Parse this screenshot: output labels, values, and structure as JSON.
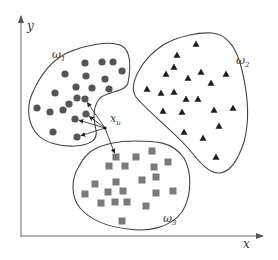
{
  "axes": {
    "x_label": "x",
    "y_label": "y",
    "color": "#6b6b6b"
  },
  "test_point": {
    "label": "x",
    "subscript": "u",
    "pos": [
      105,
      128
    ]
  },
  "classes": [
    {
      "name": "omega1",
      "label": "ω",
      "subscript": "1",
      "marker": "circle",
      "color": "#555555",
      "label_pos": [
        52,
        58
      ],
      "points": [
        [
          85,
          63
        ],
        [
          102,
          62
        ],
        [
          113,
          62
        ],
        [
          65,
          74
        ],
        [
          86,
          76
        ],
        [
          105,
          79
        ],
        [
          122,
          71
        ],
        [
          76,
          87
        ],
        [
          92,
          88
        ],
        [
          109,
          89
        ],
        [
          55,
          93
        ],
        [
          77,
          98
        ],
        [
          85,
          99
        ],
        [
          69,
          104
        ],
        [
          63,
          110
        ],
        [
          50,
          112
        ],
        [
          37,
          108
        ],
        [
          86,
          114
        ],
        [
          75,
          119
        ],
        [
          53,
          132
        ],
        [
          77,
          137
        ]
      ]
    },
    {
      "name": "omega2",
      "label": "ω",
      "subscript": "2",
      "marker": "triangle",
      "color": "#1e1e1e",
      "label_pos": [
        236,
        64
      ],
      "points": [
        [
          196,
          44
        ],
        [
          177,
          55
        ],
        [
          174,
          67
        ],
        [
          201,
          72
        ],
        [
          226,
          74
        ],
        [
          166,
          74
        ],
        [
          188,
          78
        ],
        [
          211,
          83
        ],
        [
          147,
          89
        ],
        [
          161,
          93
        ],
        [
          174,
          92
        ],
        [
          186,
          99
        ],
        [
          198,
          99
        ],
        [
          163,
          111
        ],
        [
          182,
          112
        ],
        [
          214,
          110
        ],
        [
          233,
          108
        ],
        [
          184,
          132
        ],
        [
          219,
          126
        ],
        [
          203,
          138
        ],
        [
          216,
          157
        ]
      ]
    },
    {
      "name": "omega3",
      "label": "ω",
      "subscript": "3",
      "marker": "square",
      "color": "#7a7a7a",
      "label_pos": [
        163,
        222
      ],
      "points": [
        [
          116,
          157
        ],
        [
          136,
          157
        ],
        [
          152,
          151
        ],
        [
          109,
          166
        ],
        [
          125,
          166
        ],
        [
          154,
          167
        ],
        [
          168,
          162
        ],
        [
          95,
          184
        ],
        [
          116,
          182
        ],
        [
          142,
          180
        ],
        [
          156,
          177
        ],
        [
          85,
          194
        ],
        [
          108,
          192
        ],
        [
          123,
          191
        ],
        [
          156,
          193
        ],
        [
          173,
          191
        ],
        [
          101,
          203
        ],
        [
          115,
          202
        ],
        [
          127,
          202
        ],
        [
          146,
          206
        ],
        [
          122,
          221
        ]
      ]
    }
  ],
  "knn_arrows_to": [
    [
      86,
      114
    ],
    [
      75,
      119
    ],
    [
      77,
      137
    ],
    [
      85,
      99
    ],
    [
      116,
      157
    ]
  ]
}
